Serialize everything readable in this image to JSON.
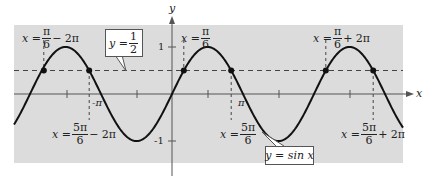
{
  "figure": {
    "type": "function-graph",
    "function_label": "y = sin x",
    "axes": {
      "x_label": "x",
      "y_label": "y",
      "x_ticks_labeled": [
        "-π",
        "π"
      ],
      "y_ticks_labeled": [
        "1",
        "-1"
      ]
    },
    "horizontal_line": {
      "label": "y = 1/2",
      "value": 0.5
    },
    "colors": {
      "background": "#ffffff",
      "plot_area": "#dcdcdc",
      "curve": "#111111",
      "dashed": "#444444"
    },
    "annotations": [
      {
        "id": "a1",
        "prefix": "x =",
        "num": "π",
        "den": "6",
        "suffix": "− 2π"
      },
      {
        "id": "a2",
        "prefix": "x =",
        "num": "π",
        "den": "6",
        "suffix": ""
      },
      {
        "id": "a3",
        "prefix": "x =",
        "num": "π",
        "den": "6",
        "suffix": "+ 2π"
      },
      {
        "id": "a4",
        "prefix": "x =",
        "num": "5π",
        "den": "6",
        "suffix": "− 2π"
      },
      {
        "id": "a5",
        "prefix": "x =",
        "num": "5π",
        "den": "6",
        "suffix": ""
      },
      {
        "id": "a6",
        "prefix": "x =",
        "num": "5π",
        "den": "6",
        "suffix": "+ 2π"
      }
    ],
    "intersection_points": [
      "π/6 − 2π",
      "5π/6 − 2π",
      "π/6",
      "5π/6",
      "π/6 + 2π",
      "5π/6 + 2π"
    ],
    "box_labels": {
      "half_num": "1",
      "half_den": "2",
      "half_prefix": "y =",
      "sin": "y = sin x"
    }
  }
}
